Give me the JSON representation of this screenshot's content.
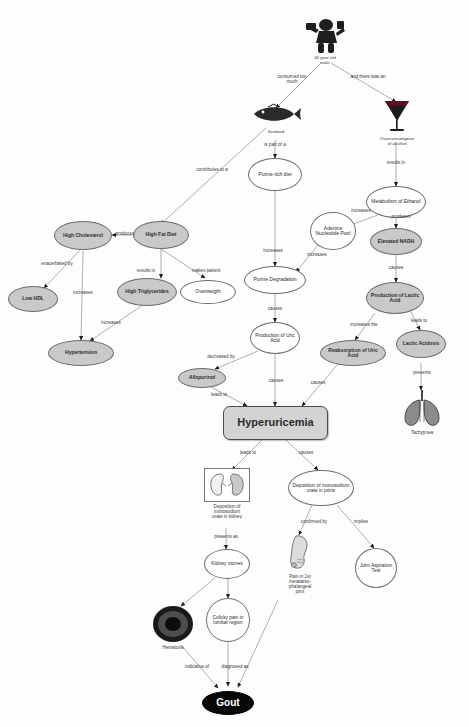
{
  "diagram": {
    "colors": {
      "node_grey": "#c9c9c9",
      "node_white": "#fefefe",
      "node_black": "#080808",
      "central_box": "#d3d3d3",
      "edge": "#8d8d8d",
      "text": "#2b2b2b"
    }
  },
  "nodes": [
    {
      "id": "patient_label",
      "label": "40 year old\nmale",
      "shape": "image-caption"
    },
    {
      "id": "seafood",
      "label": "Seafood",
      "shape": "image-caption"
    },
    {
      "id": "alcohol",
      "label": "Overconsumption\nof alcohol",
      "shape": "image-caption"
    },
    {
      "id": "purine_rich_diet",
      "label": "Purine rich\ndiet",
      "shape": "ellipse-white"
    },
    {
      "id": "metabolism_ethanol",
      "label": "Metabolism\nof Ethanol",
      "shape": "ellipse-white"
    },
    {
      "id": "high_fat_diet",
      "label": "High Fat\nDiet",
      "shape": "ellipse-grey"
    },
    {
      "id": "high_cholesterol",
      "label": "High\nCholesterol",
      "shape": "ellipse-grey"
    },
    {
      "id": "low_hdl",
      "label": "Low HDL",
      "shape": "ellipse-grey"
    },
    {
      "id": "high_triglycerides",
      "label": "High\nTriglycerides",
      "shape": "ellipse-grey"
    },
    {
      "id": "overweight",
      "label": "Overweight",
      "shape": "ellipse-white"
    },
    {
      "id": "hypertension",
      "label": "Hypertension",
      "shape": "ellipse-grey"
    },
    {
      "id": "adenine_nucleotide_pool",
      "label": "Adenine\nNucleotide\nPool",
      "shape": "ellipse-white"
    },
    {
      "id": "elevated_nadh",
      "label": "Elevated\nNADH",
      "shape": "ellipse-grey"
    },
    {
      "id": "purine_degradation",
      "label": "Purine\nDegradation",
      "shape": "ellipse-white"
    },
    {
      "id": "production_lactic_acid",
      "label": "Production\nof Lactic\nAcid",
      "shape": "ellipse-grey"
    },
    {
      "id": "production_uric_acid",
      "label": "Production\nof Uric\nAcid",
      "shape": "ellipse-white"
    },
    {
      "id": "reabsorption_uric_acid",
      "label": "Reabsorption\nof Uric Acid",
      "shape": "ellipse-grey"
    },
    {
      "id": "lactic_acidosis",
      "label": "Lactic\nAcidosis",
      "shape": "ellipse-grey"
    },
    {
      "id": "allopurinol",
      "label": "Allopurinol",
      "shape": "ellipse-grey"
    },
    {
      "id": "tachypnea",
      "label": "Tachypnea",
      "shape": "image-caption"
    },
    {
      "id": "hyperuricemia",
      "label": "Hyperuricemia",
      "shape": "rounded-box"
    },
    {
      "id": "deposition_kidney",
      "label": "Deposition of\nmonosodium\nurate in kidney",
      "shape": "image-caption"
    },
    {
      "id": "deposition_joints",
      "label": "Deposition of\nmonosodium\nurate in joints",
      "shape": "ellipse-white"
    },
    {
      "id": "kidney_stones",
      "label": "Kidney\nstones",
      "shape": "ellipse-white"
    },
    {
      "id": "mtp_pain",
      "label": "Pain in 1st\nmetatarso-\nphalangeal\njoint",
      "shape": "image-caption"
    },
    {
      "id": "joint_aspiration_test",
      "label": "Joint\nAspiration\nTest",
      "shape": "ellipse-white"
    },
    {
      "id": "hematuria",
      "label": "Hematuria",
      "shape": "image-caption"
    },
    {
      "id": "colicky_pain",
      "label": "Colicky\npain in\nlumbar\nregion",
      "shape": "ellipse-white"
    },
    {
      "id": "gout",
      "label": "Gout",
      "shape": "ellipse-black"
    }
  ],
  "edge_labels": [
    {
      "id": "e1",
      "text": "consumed too\nmuch"
    },
    {
      "id": "e2",
      "text": "and there was an"
    },
    {
      "id": "e3",
      "text": "is part of a"
    },
    {
      "id": "e4",
      "text": "results in"
    },
    {
      "id": "e5",
      "text": "contributes to a"
    },
    {
      "id": "e6",
      "text": "produces"
    },
    {
      "id": "e7",
      "text": "exacerbated by"
    },
    {
      "id": "e8",
      "text": "increases"
    },
    {
      "id": "e9",
      "text": "results in"
    },
    {
      "id": "e10",
      "text": "makes patient"
    },
    {
      "id": "e11",
      "text": "increases"
    },
    {
      "id": "e12",
      "text": "increases"
    },
    {
      "id": "e13",
      "text": "produces"
    },
    {
      "id": "e14",
      "text": "increases"
    },
    {
      "id": "e15",
      "text": "causes"
    },
    {
      "id": "e16",
      "text": "increases"
    },
    {
      "id": "e17",
      "text": "increases the"
    },
    {
      "id": "e18",
      "text": "leads to"
    },
    {
      "id": "e19",
      "text": "decreased by"
    },
    {
      "id": "e20",
      "text": "causes"
    },
    {
      "id": "e21",
      "text": "causes"
    },
    {
      "id": "e22",
      "text": "causes"
    },
    {
      "id": "e23",
      "text": "prevents"
    },
    {
      "id": "e24",
      "text": "leads to"
    },
    {
      "id": "e25",
      "text": "leads to"
    },
    {
      "id": "e26",
      "text": "causes"
    },
    {
      "id": "e27",
      "text": "presents as"
    },
    {
      "id": "e28",
      "text": "confirmed by"
    },
    {
      "id": "e29",
      "text": "implies"
    },
    {
      "id": "e30",
      "text": "indicative of"
    },
    {
      "id": "e31",
      "text": "diagnosed as"
    }
  ]
}
